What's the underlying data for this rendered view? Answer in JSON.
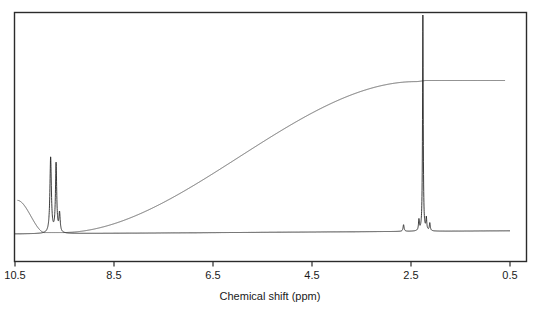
{
  "figure": {
    "kind": "nmr-spectrum",
    "background_color": "#ffffff",
    "frame_color": "#2b2b2b",
    "trace_color": "#2b2b2b",
    "integral_color": "#4a4a4a"
  },
  "axis": {
    "title": "Chemical shift (ppm)",
    "tick_labels": [
      "10.5",
      "8.5",
      "6.5",
      "4.5",
      "2.5",
      "0.5"
    ],
    "tick_values": [
      10.5,
      8.5,
      6.5,
      4.5,
      2.5,
      0.5
    ]
  },
  "chart_data": {
    "type": "line",
    "title": "",
    "subtitle": "",
    "xlabel": "Chemical shift (ppm)",
    "ylabel": "",
    "xlim": [
      10.5,
      0.5
    ],
    "x_reversed": true,
    "ylim": [
      0,
      1
    ],
    "grid": false,
    "legend": "none",
    "annotations": [],
    "series": [
      {
        "name": "spectrum",
        "kind": "spectrum-trace",
        "baseline": 0.02,
        "peaks": [
          {
            "shift": 9.78,
            "height": 0.34,
            "width": 0.035,
            "label": "aldehyde/aromatic-downfield"
          },
          {
            "shift": 9.67,
            "height": 0.31,
            "width": 0.03,
            "label": "aldehyde/aromatic-downfield-b"
          },
          {
            "shift": 9.6,
            "height": 0.085,
            "width": 0.03,
            "label": "shoulder"
          },
          {
            "shift": 2.65,
            "height": 0.03,
            "width": 0.025,
            "label": "minor"
          },
          {
            "shift": 2.34,
            "height": 0.048,
            "width": 0.02,
            "label": "minor-b"
          },
          {
            "shift": 2.26,
            "height": 0.985,
            "width": 0.016,
            "label": "methyl-main"
          },
          {
            "shift": 2.19,
            "height": 0.055,
            "width": 0.02,
            "label": "minor-c"
          },
          {
            "shift": 2.12,
            "height": 0.035,
            "width": 0.022,
            "label": "minor-d"
          }
        ]
      },
      {
        "name": "integral",
        "kind": "integration-trace",
        "steps": [
          {
            "start_shift": 10.45,
            "end_shift": 9.9,
            "level": 0.165,
            "label": "integral-start-plateau"
          },
          {
            "start_shift": 9.9,
            "end_shift": 9.55,
            "level": 0.02,
            "label": "integral-step-aromatic"
          },
          {
            "start_shift": 9.55,
            "end_shift": 2.4,
            "level": 0.02,
            "label": "integral-flat"
          },
          {
            "start_shift": 2.4,
            "end_shift": 2.18,
            "level": 0.7,
            "label": "integral-step-methyl"
          },
          {
            "start_shift": 2.18,
            "end_shift": 0.6,
            "level": 0.705,
            "label": "integral-end-plateau"
          }
        ]
      }
    ]
  }
}
